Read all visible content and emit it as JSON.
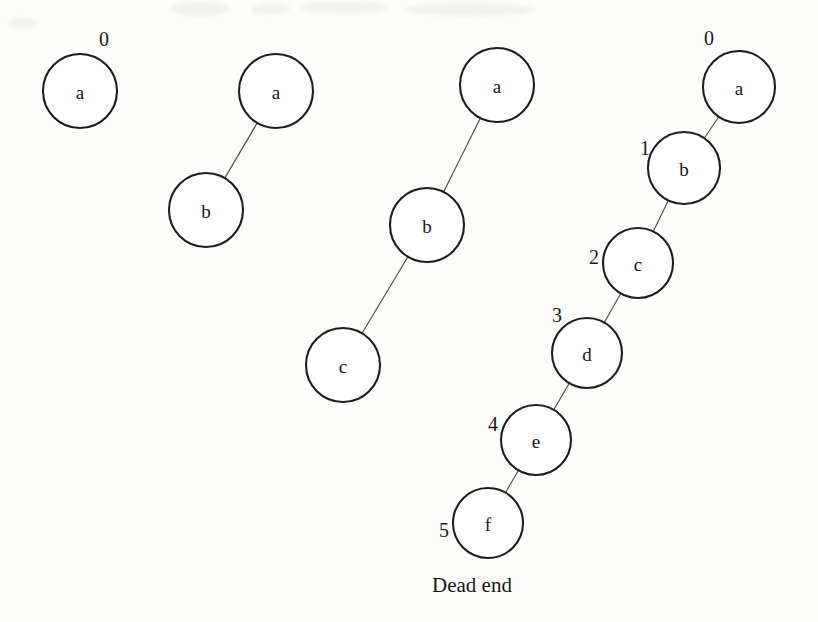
{
  "figure": {
    "caption": "Dead end",
    "caption_x": 432,
    "caption_y": 592,
    "node_radius": 36,
    "stroke_color": "#1d1d1d",
    "edge_color": "#4a4a4a",
    "background_color": "#fdfdfc",
    "text_color": "#161616"
  },
  "trees": [
    {
      "name": "stage-1",
      "nodes": [
        {
          "id": "t1-a",
          "label": "a",
          "cx": 80,
          "cy": 91,
          "r": 37,
          "step": "0",
          "step_x": 104,
          "step_y": 39
        }
      ],
      "edges": []
    },
    {
      "name": "stage-2",
      "nodes": [
        {
          "id": "t2-a",
          "label": "a",
          "cx": 276,
          "cy": 91,
          "r": 37,
          "step": null,
          "step_x": null,
          "step_y": null
        },
        {
          "id": "t2-b",
          "label": "b",
          "cx": 206,
          "cy": 210,
          "r": 37,
          "step": null,
          "step_x": null,
          "step_y": null
        }
      ],
      "edges": [
        {
          "from": "t2-a",
          "to": "t2-b"
        }
      ]
    },
    {
      "name": "stage-3",
      "nodes": [
        {
          "id": "t3-a",
          "label": "a",
          "cx": 497,
          "cy": 85,
          "r": 37,
          "step": null,
          "step_x": null,
          "step_y": null
        },
        {
          "id": "t3-b",
          "label": "b",
          "cx": 427,
          "cy": 225,
          "r": 37,
          "step": null,
          "step_x": null,
          "step_y": null
        },
        {
          "id": "t3-c",
          "label": "c",
          "cx": 343,
          "cy": 365,
          "r": 37,
          "step": null,
          "step_x": null,
          "step_y": null
        }
      ],
      "edges": [
        {
          "from": "t3-a",
          "to": "t3-b"
        },
        {
          "from": "t3-b",
          "to": "t3-c"
        }
      ]
    },
    {
      "name": "stage-4",
      "nodes": [
        {
          "id": "t4-a",
          "label": "a",
          "cx": 739,
          "cy": 87,
          "r": 36,
          "step": "0",
          "step_x": 709,
          "step_y": 38
        },
        {
          "id": "t4-b",
          "label": "b",
          "cx": 684,
          "cy": 168,
          "r": 36,
          "step": "1",
          "step_x": 645,
          "step_y": 148
        },
        {
          "id": "t4-c",
          "label": "c",
          "cx": 638,
          "cy": 263,
          "r": 35,
          "step": "2",
          "step_x": 594,
          "step_y": 257
        },
        {
          "id": "t4-d",
          "label": "d",
          "cx": 587,
          "cy": 353,
          "r": 35,
          "step": "3",
          "step_x": 557,
          "step_y": 315
        },
        {
          "id": "t4-e",
          "label": "e",
          "cx": 536,
          "cy": 440,
          "r": 35,
          "step": "4",
          "step_x": 493,
          "step_y": 424
        },
        {
          "id": "t4-f",
          "label": "f",
          "cx": 488,
          "cy": 523,
          "r": 35,
          "step": "5",
          "step_x": 444,
          "step_y": 530
        }
      ],
      "edges": [
        {
          "from": "t4-a",
          "to": "t4-b"
        },
        {
          "from": "t4-b",
          "to": "t4-c"
        },
        {
          "from": "t4-c",
          "to": "t4-d"
        },
        {
          "from": "t4-d",
          "to": "t4-e"
        },
        {
          "from": "t4-e",
          "to": "t4-f"
        }
      ]
    }
  ],
  "scan_artifacts": [
    {
      "x": 170,
      "y": 2,
      "w": 60,
      "h": 14
    },
    {
      "x": 250,
      "y": 4,
      "w": 40,
      "h": 10
    },
    {
      "x": 300,
      "y": 1,
      "w": 90,
      "h": 12
    },
    {
      "x": 405,
      "y": 3,
      "w": 130,
      "h": 13
    },
    {
      "x": 8,
      "y": 18,
      "w": 30,
      "h": 10
    }
  ]
}
